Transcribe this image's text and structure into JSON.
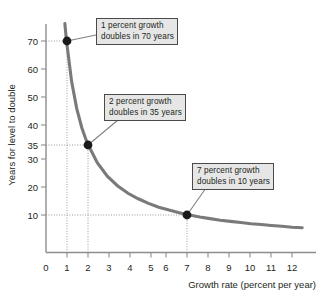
{
  "chart_data": {
    "type": "line",
    "title": "",
    "xlabel": "Growth rate (percent per year)",
    "ylabel": "Years for level to double",
    "xlim": [
      0,
      12.6
    ],
    "ylim": [
      0,
      76
    ],
    "xticks": [
      "0",
      "1",
      "2",
      "3",
      "4",
      "5",
      "6",
      "7",
      "8",
      "9",
      "10",
      "11",
      "12"
    ],
    "xtick_values": [
      0,
      1,
      2,
      3,
      4,
      5,
      6,
      7,
      8,
      9,
      10,
      11,
      12
    ],
    "yticks": [
      "10",
      "20",
      "30",
      "35",
      "40",
      "50",
      "60",
      "70"
    ],
    "ytick_values": [
      10,
      20,
      30,
      35,
      40,
      50,
      60,
      70
    ],
    "grid": false,
    "legend": "none",
    "series": [
      {
        "name": "Doubling time (rule of 70)",
        "formula": "y = 70 / x",
        "color": "#7a7a7a",
        "x": [
          0.92,
          1,
          1.25,
          1.5,
          1.75,
          2,
          2.5,
          3,
          3.5,
          4,
          4.5,
          5,
          5.5,
          6,
          6.5,
          7,
          7.5,
          8,
          8.5,
          9,
          9.5,
          10,
          10.5,
          11,
          11.5,
          12,
          12.5
        ],
        "values": [
          76,
          70,
          56,
          46.7,
          40,
          35,
          28,
          23.3,
          20,
          17.5,
          15.6,
          14,
          12.7,
          11.7,
          10.8,
          10,
          9.3,
          8.75,
          8.2,
          7.8,
          7.4,
          7,
          6.7,
          6.4,
          6.1,
          5.8,
          5.6
        ]
      }
    ],
    "points": [
      {
        "label": "1 percent growth",
        "x": 1,
        "y": 70
      },
      {
        "label": "2 percent growth",
        "x": 2,
        "y": 35
      },
      {
        "label": "7 percent growth",
        "x": 7,
        "y": 10
      }
    ],
    "annotations": [
      {
        "line1": "1 percent growth",
        "line2": "doubles in 70 years",
        "x": 1,
        "y": 70
      },
      {
        "line1": "2 percent growth",
        "line2": "doubles in 35 years",
        "x": 2,
        "y": 35
      },
      {
        "line1": "7 percent growth",
        "line2": "doubles in 10 years",
        "x": 7,
        "y": 10
      }
    ]
  },
  "axes": {
    "x_title": "Growth rate (percent per year)",
    "y_title": "Years for level to double",
    "x_tick_labels": [
      "0",
      "1",
      "2",
      "3",
      "4",
      "5",
      "6",
      "7",
      "8",
      "9",
      "10",
      "11",
      "12"
    ],
    "y_tick_labels": [
      "70",
      "60",
      "50",
      "40",
      "35",
      "30",
      "20",
      "10"
    ]
  },
  "colors": {
    "curve": "#7a7a7a",
    "axis": "#8d8d8d",
    "marker": "#1a1a1a",
    "callout_fill": "#e6e6e6",
    "callout_border": "#4a4a4a",
    "text": "#231f20"
  }
}
